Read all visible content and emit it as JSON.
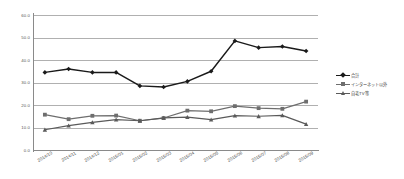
{
  "chart_data": {
    "type": "line",
    "title": "",
    "xlabel": "",
    "ylabel": "",
    "ylim": [
      0.0,
      60.0
    ],
    "ytick_step": 10.0,
    "grid": "horizontal",
    "legend_position": "right",
    "categories": [
      "2014/10",
      "2014/11",
      "2014/12",
      "2015/01",
      "2015/02",
      "2015/03",
      "2015/04",
      "2015/05",
      "2015/06",
      "2015/07",
      "2015/08",
      "2015/09"
    ],
    "ytick_labels": [
      "60.0",
      "50.0",
      "40.0",
      "30.0",
      "20.0",
      "10.0",
      "0.0"
    ],
    "ytick_values": [
      60.0,
      50.0,
      40.0,
      30.0,
      20.0,
      10.0,
      0.0
    ],
    "series": [
      {
        "name": "合計",
        "color": "#1a1a1a",
        "marker": "diamond",
        "values": [
          34.5,
          36.0,
          34.5,
          34.5,
          28.5,
          28.0,
          30.5,
          35.0,
          48.5,
          45.5,
          46.0,
          44.0
        ]
      },
      {
        "name": "インターネット以外",
        "color": "#6e6e6e",
        "marker": "square",
        "values": [
          15.7,
          13.7,
          15.2,
          15.3,
          13.0,
          14.2,
          17.5,
          17.2,
          19.5,
          18.6,
          18.3,
          21.5
        ]
      },
      {
        "name": "自宅TV等",
        "color": "#5a5a5a",
        "marker": "triangle",
        "values": [
          9.0,
          10.8,
          12.3,
          13.5,
          13.0,
          14.3,
          14.6,
          13.5,
          15.3,
          15.0,
          15.4,
          11.5
        ]
      }
    ]
  },
  "legend": {
    "items": [
      {
        "label": "合計"
      },
      {
        "label": "インターネット以外"
      },
      {
        "label": "自宅TV等"
      }
    ]
  }
}
